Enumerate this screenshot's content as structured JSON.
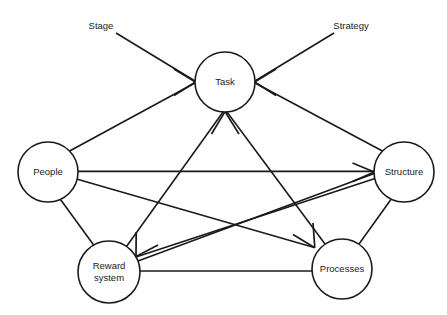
{
  "diagram": {
    "canvas": {
      "width": 447,
      "height": 315,
      "background": "#ffffff"
    },
    "stroke_color": "#1a1a1a",
    "node_fill": "#ffffff",
    "nodes": [
      {
        "id": "task",
        "label": "Task",
        "label_line1": "Task",
        "label_line2": "",
        "cx": 225,
        "cy": 82,
        "r": 30
      },
      {
        "id": "people",
        "label": "People",
        "label_line1": "People",
        "label_line2": "",
        "cx": 48,
        "cy": 172,
        "r": 30
      },
      {
        "id": "structure",
        "label": "Structure",
        "label_line1": "Structure",
        "label_line2": "",
        "cx": 404,
        "cy": 172,
        "r": 30
      },
      {
        "id": "reward",
        "label": "Reward system",
        "label_line1": "Reward",
        "label_line2": "system",
        "cx": 109,
        "cy": 272,
        "r": 31
      },
      {
        "id": "processes",
        "label": "Processes",
        "label_line1": "Processes",
        "label_line2": "",
        "cx": 342,
        "cy": 269,
        "r": 30
      }
    ],
    "external_labels": [
      {
        "id": "stage",
        "text": "Stage",
        "x": 101,
        "y": 26
      },
      {
        "id": "strategy",
        "text": "Strategy",
        "x": 351,
        "y": 26
      }
    ],
    "edges": [
      {
        "id": "stage-to-task",
        "from": "Stage label",
        "to": "Task",
        "arrow": "to"
      },
      {
        "id": "strategy-to-task",
        "from": "Strategy label",
        "to": "Task",
        "arrow": "to"
      },
      {
        "id": "people-to-task",
        "from": "People",
        "to": "Task",
        "arrow": "to"
      },
      {
        "id": "structure-to-task",
        "from": "Structure",
        "to": "Task",
        "arrow": "to"
      },
      {
        "id": "reward-to-task",
        "from": "Reward system",
        "to": "Task",
        "arrow": "to"
      },
      {
        "id": "processes-to-task",
        "from": "Processes",
        "to": "Task",
        "arrow": "to"
      },
      {
        "id": "people-to-structure",
        "from": "People",
        "to": "Structure",
        "arrow": "to"
      },
      {
        "id": "reward-to-structure",
        "from": "Reward system",
        "to": "Structure",
        "arrow": "to"
      },
      {
        "id": "people-to-processes",
        "from": "People",
        "to": "Processes",
        "arrow": "to"
      },
      {
        "id": "structure-to-reward",
        "from": "Structure",
        "to": "Reward system",
        "arrow": "to"
      },
      {
        "id": "people-to-reward",
        "from": "People",
        "to": "Reward system",
        "arrow": "none"
      },
      {
        "id": "structure-to-processes",
        "from": "Structure",
        "to": "Processes",
        "arrow": "none"
      },
      {
        "id": "reward-to-processes",
        "from": "Reward system",
        "to": "Processes",
        "arrow": "none"
      }
    ]
  }
}
